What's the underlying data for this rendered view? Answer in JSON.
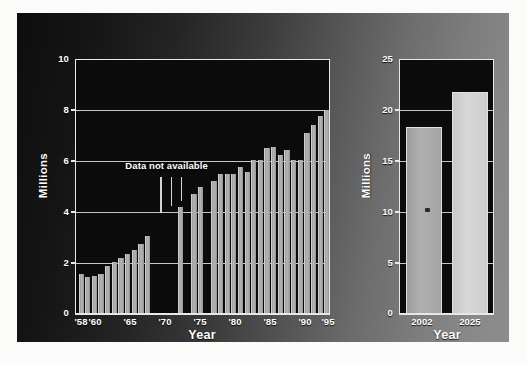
{
  "figure": {
    "background_dark": "#0c0c0c",
    "background_light": "#8d8d8d",
    "bar_color": "#a9a9a9",
    "bar_color_bright": "#d2d2d2",
    "axis_color": "#e9e9e9"
  },
  "chart_data": [
    {
      "type": "bar",
      "title": "",
      "xlabel": "Year",
      "ylabel": "Millions",
      "ylim": [
        0,
        10
      ],
      "yticks": [
        0,
        2,
        4,
        6,
        8,
        10
      ],
      "ytick_labels": [
        "0",
        "2",
        "4",
        "6",
        "8",
        "10"
      ],
      "grid": true,
      "xtick_labels": [
        "'58",
        "'60",
        "'65",
        "'70",
        "'75",
        "'80",
        "'85",
        "'90",
        "'95"
      ],
      "xtick_years": [
        1958,
        1960,
        1965,
        1970,
        1975,
        1980,
        1985,
        1990,
        1995
      ],
      "annotations": [
        {
          "text": "Data not available",
          "x_year": 1971.5,
          "y": 5.9,
          "leader_years": [
            1970.0,
            1971.6,
            1973.1
          ]
        }
      ],
      "categories": [
        1958,
        1959,
        1960,
        1961,
        1962,
        1963,
        1964,
        1965,
        1966,
        1967,
        1968,
        1973,
        1975,
        1976,
        1978,
        1979,
        1980,
        1981,
        1982,
        1983,
        1984,
        1985,
        1986,
        1987,
        1988,
        1989,
        1990,
        1991,
        1992,
        1993,
        1994,
        1995
      ],
      "values": [
        1.55,
        1.45,
        1.5,
        1.55,
        1.9,
        2.05,
        2.2,
        2.35,
        2.5,
        2.75,
        3.05,
        4.2,
        4.7,
        5.0,
        5.2,
        5.5,
        5.5,
        5.5,
        5.75,
        5.55,
        6.05,
        6.05,
        6.5,
        6.55,
        6.25,
        6.45,
        6.05,
        6.05,
        7.1,
        7.4,
        7.75,
        8.0
      ],
      "missing_years": [
        1969,
        1970,
        1971,
        1972,
        1974,
        1977
      ],
      "missing_note": "Data not available"
    },
    {
      "type": "bar",
      "title": "",
      "xlabel": "Year",
      "ylabel": "Millions",
      "ylim": [
        0,
        25
      ],
      "yticks": [
        0,
        5,
        10,
        15,
        20,
        25
      ],
      "ytick_labels": [
        "0",
        "5",
        "10",
        "15",
        "20",
        "25"
      ],
      "grid": true,
      "categories": [
        "2002",
        "2025"
      ],
      "values": [
        18.3,
        21.8
      ]
    }
  ]
}
